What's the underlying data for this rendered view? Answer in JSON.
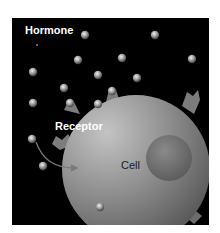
{
  "figure": {
    "labels": {
      "hormone": "Hormone",
      "receptor": "Receptor",
      "cell": "Cell"
    },
    "colors": {
      "background": "#000000",
      "page": "#ffffff",
      "hormone_light": "#e0e0e0",
      "hormone_dark": "#505050",
      "cell_light": "#b8b8b8",
      "cell_dark": "#5a5a5a",
      "nucleus": "#6e6e6e",
      "label_text": "#ffffff",
      "cell_text": "#1a1a1a"
    },
    "hormones": [
      {
        "x": 73,
        "y": 17
      },
      {
        "x": 143,
        "y": 17
      },
      {
        "x": 66,
        "y": 42
      },
      {
        "x": 110,
        "y": 40
      },
      {
        "x": 180,
        "y": 41
      },
      {
        "x": 21,
        "y": 54
      },
      {
        "x": 52,
        "y": 70
      },
      {
        "x": 86,
        "y": 57
      },
      {
        "x": 125,
        "y": 60
      },
      {
        "x": 21,
        "y": 85
      },
      {
        "x": 86,
        "y": 86
      },
      {
        "x": 20,
        "y": 121
      },
      {
        "x": 31,
        "y": 148
      },
      {
        "x": 88,
        "y": 189
      }
    ],
    "bound_hormones": [
      {
        "x": 58,
        "y": 85
      },
      {
        "x": 100,
        "y": 73
      }
    ]
  }
}
